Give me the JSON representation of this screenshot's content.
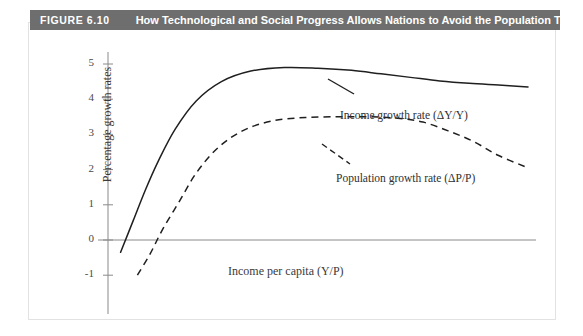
{
  "header": {
    "figure_number": "FIGURE 6.10",
    "title": "How Technological and Social Progress Allows Nations to Avoid the Population Trap",
    "band_color": "#6e6e6e",
    "text_color": "#ffffff"
  },
  "chart_data": {
    "type": "line",
    "title": "How Technological and Social Progress Allows Nations to Avoid the Population Trap",
    "xlabel": "Income per capita (Y/P)",
    "ylabel": "Percentage growth rates",
    "ylim": [
      -1.6,
      5.5
    ],
    "xlim": [
      0,
      100
    ],
    "grid": false,
    "legend": "inline-annotations",
    "ytick_labels": [
      "5",
      "4",
      "3",
      "2",
      "1",
      "0",
      "-1"
    ],
    "ytick_values": [
      5,
      4,
      3,
      2,
      1,
      0,
      -1
    ],
    "xtick_labels": [],
    "series": [
      {
        "name": "Income growth rate (ΔY/Y)",
        "style": "solid",
        "color": "#1f1f1f",
        "x": [
          3,
          6,
          9,
          12,
          16,
          21,
          27,
          34,
          42,
          50,
          58,
          65,
          72,
          79,
          86,
          93,
          100
        ],
        "values": [
          -0.35,
          0.55,
          1.45,
          2.25,
          3.15,
          3.95,
          4.5,
          4.8,
          4.9,
          4.88,
          4.82,
          4.72,
          4.62,
          4.52,
          4.45,
          4.4,
          4.35
        ]
      },
      {
        "name": "Population growth rate (ΔP/P)",
        "style": "dashed",
        "color": "#1f1f1f",
        "x": [
          7,
          10,
          13,
          17,
          21,
          26,
          32,
          39,
          47,
          55,
          62,
          69,
          75,
          81,
          87,
          93,
          100
        ],
        "values": [
          -1.0,
          -0.4,
          0.3,
          1.1,
          1.9,
          2.6,
          3.1,
          3.38,
          3.48,
          3.5,
          3.5,
          3.46,
          3.35,
          3.1,
          2.8,
          2.4,
          2.05
        ]
      }
    ],
    "annotations": [
      {
        "name": "income-growth-annotation",
        "text": "Income growth rate (ΔY/Y)",
        "leader_line": true
      },
      {
        "name": "population-growth-annotation",
        "text": "Population growth rate (ΔP/P)",
        "leader_line": true
      }
    ],
    "axis_color": "#8a8a8a",
    "zero_line": true
  }
}
